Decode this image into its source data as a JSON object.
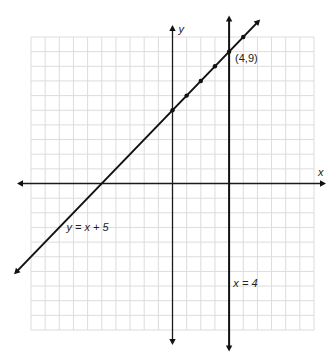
{
  "chart_data": {
    "type": "line",
    "title": "",
    "xlabel": "x",
    "ylabel": "y",
    "xlim": [
      -10,
      10
    ],
    "ylim": [
      -10,
      10
    ],
    "grid": true,
    "grid_step": 1,
    "series": [
      {
        "name": "y = x + 5",
        "kind": "line",
        "slope": 1,
        "intercept": 5,
        "x_range": [
          -11,
          6
        ],
        "marked_points": [
          [
            0,
            5
          ],
          [
            1,
            6
          ],
          [
            2,
            7
          ],
          [
            3,
            8
          ],
          [
            4,
            9
          ],
          [
            5,
            10
          ]
        ],
        "label": "y = x + 5",
        "label_anchor": [
          -7.5,
          -3
        ]
      },
      {
        "name": "x = 4",
        "kind": "vertical",
        "x": 4,
        "y_range": [
          -11.2,
          11.2
        ],
        "label": "x = 4",
        "label_anchor": [
          4.3,
          -6.8
        ]
      }
    ],
    "annotations": [
      {
        "text": "(4,9)",
        "x": 4,
        "y": 9
      }
    ]
  }
}
